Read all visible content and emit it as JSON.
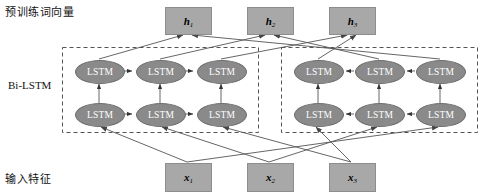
{
  "diagram": {
    "colors": {
      "box_fill": "#a8a8a8",
      "lstm_fill": "#8a8a8a",
      "line": "#555555",
      "dashed_border": "#555555",
      "background": "#ffffff"
    },
    "row_labels": {
      "top": "预训练词向量",
      "middle": "Bi-LSTM",
      "bottom": "输入特征"
    },
    "outputs": [
      {
        "id": "h1",
        "base": "h",
        "sub": "1",
        "x": 165,
        "y": 7,
        "w": 45,
        "h": 26
      },
      {
        "id": "h2",
        "base": "h",
        "sub": "2",
        "x": 247,
        "y": 7,
        "w": 45,
        "h": 26
      },
      {
        "id": "h3",
        "base": "h",
        "sub": "3",
        "x": 329,
        "y": 7,
        "w": 45,
        "h": 26
      }
    ],
    "inputs": [
      {
        "id": "x1",
        "base": "x",
        "sub": "1",
        "x": 165,
        "y": 163,
        "w": 45,
        "h": 27
      },
      {
        "id": "x2",
        "base": "x",
        "sub": "2",
        "x": 247,
        "y": 163,
        "w": 45,
        "h": 27
      },
      {
        "id": "x3",
        "base": "x",
        "sub": "3",
        "x": 329,
        "y": 163,
        "w": 45,
        "h": 27
      }
    ],
    "lstm_label": "LSTM",
    "lstm_groups": [
      {
        "name": "forward-group",
        "direction": "forward",
        "box": {
          "x": 62,
          "y": 47,
          "w": 196,
          "h": 85
        },
        "cells": [
          {
            "id": "fwd-top-1",
            "row": "top",
            "index": 1,
            "cx": 99,
            "cy": 71
          },
          {
            "id": "fwd-top-2",
            "row": "top",
            "index": 2,
            "cx": 160,
            "cy": 71
          },
          {
            "id": "fwd-top-3",
            "row": "top",
            "index": 3,
            "cx": 221,
            "cy": 71
          },
          {
            "id": "fwd-bot-1",
            "row": "bottom",
            "index": 1,
            "cx": 99,
            "cy": 114
          },
          {
            "id": "fwd-bot-2",
            "row": "bottom",
            "index": 2,
            "cx": 160,
            "cy": 114
          },
          {
            "id": "fwd-bot-3",
            "row": "bottom",
            "index": 3,
            "cx": 221,
            "cy": 114
          }
        ]
      },
      {
        "name": "backward-group",
        "direction": "backward",
        "box": {
          "x": 281,
          "y": 47,
          "w": 196,
          "h": 85
        },
        "cells": [
          {
            "id": "bwd-top-1",
            "row": "top",
            "index": 1,
            "cx": 318,
            "cy": 71
          },
          {
            "id": "bwd-top-2",
            "row": "top",
            "index": 2,
            "cx": 379,
            "cy": 71
          },
          {
            "id": "bwd-top-3",
            "row": "top",
            "index": 3,
            "cx": 440,
            "cy": 71
          },
          {
            "id": "bwd-bot-1",
            "row": "bottom",
            "index": 1,
            "cx": 318,
            "cy": 114
          },
          {
            "id": "bwd-bot-2",
            "row": "bottom",
            "index": 2,
            "cx": 379,
            "cy": 114
          },
          {
            "id": "bwd-bot-3",
            "row": "bottom",
            "index": 3,
            "cx": 440,
            "cy": 114
          }
        ]
      }
    ]
  }
}
